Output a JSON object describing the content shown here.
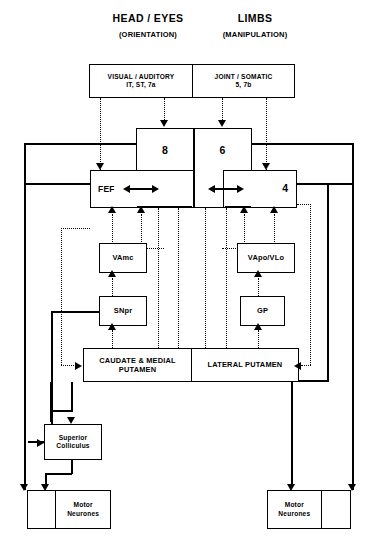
{
  "diagram": {
    "title_left_main": "HEAD / EYES",
    "title_left_sub": "(ORIENTATION)",
    "title_right_main": "LIMBS",
    "title_right_sub": "(MANIPULATION)",
    "sensory_left_line1": "VISUAL / AUDITORY",
    "sensory_left_line2": "IT, ST, 7a",
    "sensory_right_line1": "JOINT / SOMATIC",
    "sensory_right_line2": "5, 7b",
    "cortex_area_8": "8",
    "cortex_area_6": "6",
    "cortex_fef": "FEF",
    "cortex_area_4": "4",
    "thalamus_left": "VAmc",
    "thalamus_right": "VApo/VLo",
    "snpr": "SNpr",
    "gp": "GP",
    "striatum_left_line1": "CAUDATE & MEDIAL",
    "striatum_left_line2": "PUTAMEN",
    "striatum_right": "LATERAL PUTAMEN",
    "superior_colliculus_line1": "Superior",
    "superior_colliculus_line2": "Colliculus",
    "motor_neurones_left_line1": "Motor",
    "motor_neurones_left_line2": "Neurones",
    "motor_neurones_right_line1": "Motor",
    "motor_neurones_right_line2": "Neurones"
  },
  "colors": {
    "ink": "#000000",
    "paper": "#ffffff"
  }
}
